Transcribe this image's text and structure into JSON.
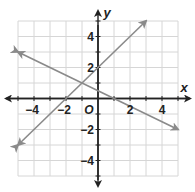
{
  "chart_data": {
    "type": "line",
    "title": "",
    "xlabel": "x",
    "ylabel": "y",
    "origin_label": "O",
    "xlim": [
      -5,
      5
    ],
    "ylim": [
      -5,
      5
    ],
    "grid": true,
    "x_tick_labels": [
      "−4",
      "−2",
      "2",
      "4"
    ],
    "x_tick_values": [
      -4,
      -2,
      2,
      4
    ],
    "y_tick_labels": [
      "4",
      "2",
      "−2",
      "−4"
    ],
    "y_tick_values": [
      4,
      2,
      -2,
      -4
    ],
    "series": [
      {
        "name": "line-1",
        "equation": "y = x + 2",
        "points": [
          [
            -5,
            -3
          ],
          [
            3,
            5
          ]
        ],
        "arrows": "both",
        "color": "#8a8a8a"
      },
      {
        "name": "line-2",
        "equation": "y = -0.5x + 0.5",
        "points": [
          [
            -5,
            3
          ],
          [
            5,
            -2
          ]
        ],
        "arrows": "both",
        "color": "#8a8a8a"
      }
    ],
    "intersection": [
      -1,
      1
    ],
    "colors": {
      "grid": "#d6d6d6",
      "axis": "#222222",
      "lines": "#8a8a8a"
    }
  }
}
